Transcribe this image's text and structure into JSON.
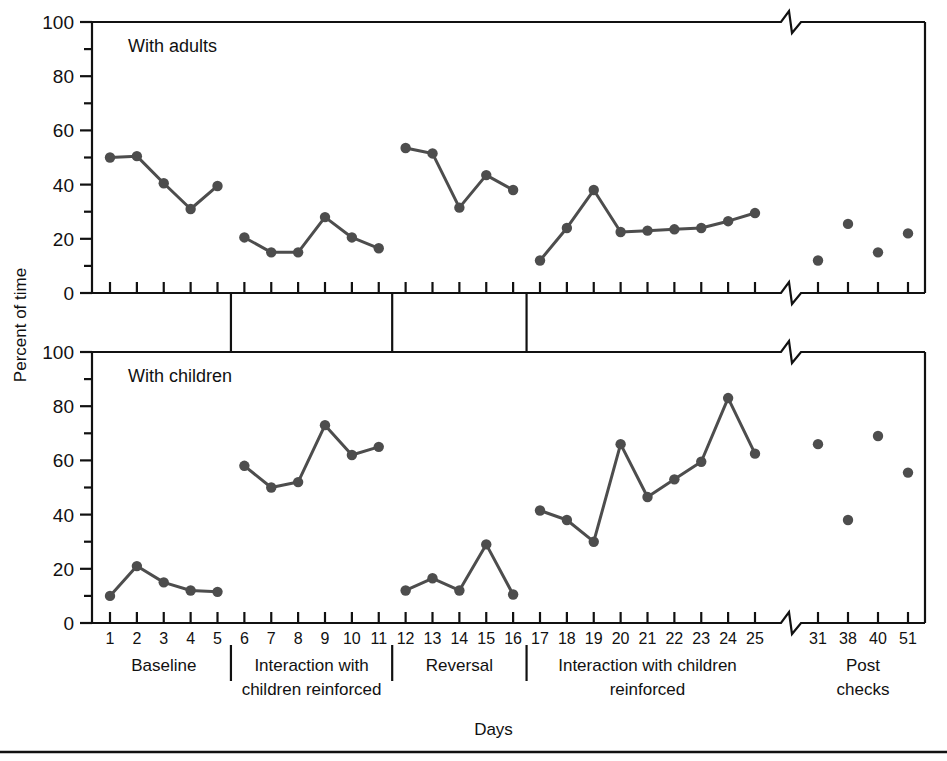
{
  "figure": {
    "y_axis_label": "Percent of time",
    "x_axis_label": "Days",
    "y_ticks_major": [
      "0",
      "20",
      "40",
      "60",
      "80",
      "100"
    ],
    "panel_top_title": "With adults",
    "panel_bottom_title": "With children",
    "axis_break_note": "slash-break",
    "line_color": "#4d4d4d",
    "marker_color": "#4d4d4d",
    "axis_color": "#111111"
  },
  "phases": [
    {
      "name": "Baseline",
      "label_lines": [
        "Baseline"
      ],
      "days": [
        1,
        2,
        3,
        4,
        5
      ]
    },
    {
      "name": "Interaction with children reinforced",
      "label_lines": [
        "Interaction with",
        "children reinforced"
      ],
      "days": [
        6,
        7,
        8,
        9,
        10,
        11
      ]
    },
    {
      "name": "Reversal",
      "label_lines": [
        "Reversal"
      ],
      "days": [
        12,
        13,
        14,
        15,
        16
      ]
    },
    {
      "name": "Interaction with children reinforced 2",
      "label_lines": [
        "Interaction with children",
        "reinforced"
      ],
      "days": [
        17,
        18,
        19,
        20,
        21,
        22,
        23,
        24,
        25
      ]
    },
    {
      "name": "Post checks",
      "label_lines": [
        "Post",
        "checks"
      ],
      "days": [
        31,
        38,
        40,
        51
      ]
    }
  ],
  "x_tick_labels": [
    "1",
    "2",
    "3",
    "4",
    "5",
    "6",
    "7",
    "8",
    "9",
    "10",
    "11",
    "12",
    "13",
    "14",
    "15",
    "16",
    "17",
    "18",
    "19",
    "20",
    "21",
    "22",
    "23",
    "24",
    "25",
    "31",
    "38",
    "40",
    "51"
  ],
  "chart_data": [
    {
      "type": "line",
      "title": "With adults",
      "xlabel": "Days",
      "ylabel": "Percent of time",
      "ylim": [
        0,
        100
      ],
      "yticks": [
        0,
        20,
        40,
        60,
        80,
        100
      ],
      "grid": false,
      "legend": "none",
      "segments": [
        {
          "phase": "Baseline",
          "x": [
            1,
            2,
            3,
            4,
            5
          ],
          "y": [
            50,
            50.5,
            40.5,
            31,
            39.5
          ],
          "connected": true
        },
        {
          "phase": "Interaction with children reinforced",
          "x": [
            6,
            7,
            8,
            9,
            10,
            11
          ],
          "y": [
            20.5,
            15,
            15,
            28,
            20.5,
            16.5
          ],
          "connected": true
        },
        {
          "phase": "Reversal",
          "x": [
            12,
            13,
            14,
            15,
            16
          ],
          "y": [
            53.5,
            51.5,
            31.5,
            43.5,
            38
          ],
          "connected": true
        },
        {
          "phase": "Interaction with children reinforced 2",
          "x": [
            17,
            18,
            19,
            20,
            21,
            22,
            23,
            24,
            25
          ],
          "y": [
            12,
            24,
            38,
            22.5,
            23,
            23.5,
            24,
            26.5,
            29.5
          ],
          "connected": true
        },
        {
          "phase": "Post checks",
          "x": [
            31,
            38,
            40,
            51
          ],
          "y": [
            12,
            25.5,
            15,
            22
          ],
          "connected": false
        }
      ]
    },
    {
      "type": "line",
      "title": "With children",
      "xlabel": "Days",
      "ylabel": "Percent of time",
      "ylim": [
        0,
        100
      ],
      "yticks": [
        0,
        20,
        40,
        60,
        80,
        100
      ],
      "grid": false,
      "legend": "none",
      "segments": [
        {
          "phase": "Baseline",
          "x": [
            1,
            2,
            3,
            4,
            5
          ],
          "y": [
            10,
            21,
            15,
            12,
            11.5
          ],
          "connected": true
        },
        {
          "phase": "Interaction with children reinforced",
          "x": [
            6,
            7,
            8,
            9,
            10,
            11
          ],
          "y": [
            58,
            50,
            52,
            73,
            62,
            65
          ],
          "connected": true
        },
        {
          "phase": "Reversal",
          "x": [
            12,
            13,
            14,
            15,
            16
          ],
          "y": [
            12,
            16.5,
            12,
            29,
            10.5
          ],
          "connected": true
        },
        {
          "phase": "Interaction with children reinforced 2",
          "x": [
            17,
            18,
            19,
            20,
            21,
            22,
            23,
            24,
            25
          ],
          "y": [
            41.5,
            38,
            30,
            66,
            46.5,
            53,
            59.5,
            83,
            62.5
          ],
          "connected": true
        },
        {
          "phase": "Post checks",
          "x": [
            31,
            38,
            40,
            51
          ],
          "y": [
            66,
            38,
            69,
            55.5
          ],
          "connected": false
        }
      ]
    }
  ]
}
